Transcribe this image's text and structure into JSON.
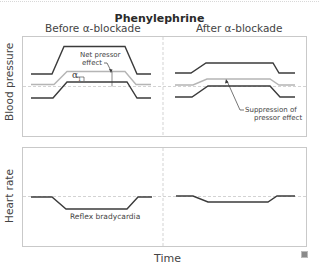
{
  "figure": {
    "title": "Phenylephrine",
    "columns": [
      {
        "label": "Before α-blockade"
      },
      {
        "label": "After α-blockade"
      }
    ],
    "panels": [
      {
        "ylabel": "Blood pressure"
      },
      {
        "ylabel": "Heart rate"
      }
    ],
    "xlabel": "Time",
    "annotations": {
      "net_pressor_line1": "Net pressor",
      "net_pressor_line2": "effect",
      "alpha1": "α",
      "alpha1_sub": "1",
      "suppression_line1": "Suppression of",
      "suppression_line2": "pressor effect",
      "reflex_bradycardia": "Reflex bradycardia"
    },
    "corner_icon": "image-enlarge-icon",
    "colors": {
      "line_dark": "#3b3b3b",
      "line_gray": "#b5b5b5",
      "reference_dashed": "#c8c8c8",
      "panel_border": "#c9c9c9"
    }
  }
}
